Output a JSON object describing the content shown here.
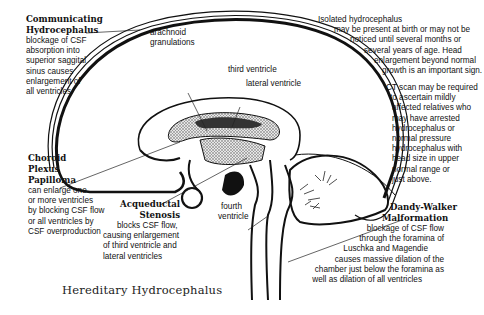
{
  "title": "Hereditary Hydrocephalus",
  "anatomy_labels": {
    "arachnoid": [
      "arachnoid",
      "granulations"
    ],
    "third_ventricle": "third ventricle",
    "lateral_ventricle": "lateral ventricle",
    "fourth_ventricle": [
      "fourth",
      "ventricle"
    ]
  },
  "conditions": {
    "communicating": {
      "heading": [
        "Communicating",
        "Hydrocephalus"
      ],
      "description": [
        "blockage of CSF",
        "absorption into",
        "superior saggital",
        "sinus causes",
        "enlargement of",
        "all ventricles"
      ]
    },
    "choroid": {
      "heading": [
        "Choroid",
        "Plexus",
        "Papilloma"
      ],
      "description": [
        "can enlarge one",
        "or more ventricles",
        "by blocking CSF flow",
        "or all ventricles by",
        "CSF overproduction"
      ]
    },
    "aqueductal": {
      "heading": [
        "Acqueductal",
        "Stenosis"
      ],
      "description": [
        "blocks CSF flow,",
        "causing enlargement",
        "of third ventricle and",
        "lateral ventricles"
      ]
    },
    "isolated": {
      "description": [
        "Isolated hydrocephalus",
        "may be present at birth or may not be",
        "noticed until several months or",
        "several years of age. Head",
        "enlargement beyond normal",
        "growth is an important sign."
      ]
    },
    "ct_scan": {
      "description": [
        "CT scan may be required",
        "to ascertain mildly",
        "affected relatives who",
        "may have arrested",
        "hydrocephalus or",
        "normal pressure",
        "hydrocephalus with",
        "head size in upper",
        "normal range or",
        "just above."
      ]
    },
    "dandy_walker": {
      "heading": [
        "Dandy-Walker",
        "Malformation"
      ],
      "description": [
        "blockage of CSF flow",
        "through the foramina of",
        "Luschka and Magendie",
        "causes massive dilation of the",
        "chamber just below the foramina as",
        "well as dilation of all ventricles"
      ]
    }
  },
  "colors": {
    "ink": "#111111",
    "background": "#ffffff",
    "ventricle_fill": "#bdbdbd"
  }
}
